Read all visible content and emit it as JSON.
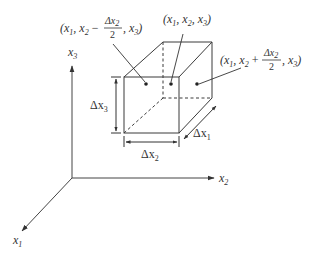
{
  "diagram": {
    "axes": {
      "x1": {
        "label": "x",
        "sub": "1"
      },
      "x2": {
        "label": "x",
        "sub": "2"
      },
      "x3": {
        "label": "x",
        "sub": "3"
      }
    },
    "dimensions": {
      "dx1": {
        "label": "Δx",
        "sub": "1"
      },
      "dx2": {
        "label": "Δx",
        "sub": "2"
      },
      "dx3": {
        "label": "Δx",
        "sub": "3"
      }
    },
    "points": [
      {
        "name": "left-face-center",
        "text": "(x1, x2 − Δx2/2, x3)"
      },
      {
        "name": "center",
        "text": "(x1, x2, x3)"
      },
      {
        "name": "right-face-center",
        "text": "(x1, x2 + Δx2/2, x3)"
      }
    ],
    "colors": {
      "line": "#3a3a3a",
      "dot": "#222222",
      "text": "#333333"
    }
  }
}
